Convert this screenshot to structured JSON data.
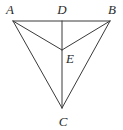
{
  "figure": {
    "background_color": "#ffffff",
    "stroke_color": "#3a3a3a",
    "stroke_width": 1,
    "label_color": "#2b2b2b",
    "width": 123,
    "height": 130
  },
  "points": [
    {
      "name": "A",
      "label": "A",
      "x": 13,
      "y": 21,
      "label_x": 10,
      "label_y": 9
    },
    {
      "name": "D",
      "label": "D",
      "x": 62,
      "y": 21,
      "label_x": 62,
      "label_y": 9
    },
    {
      "name": "B",
      "label": "B",
      "x": 110,
      "y": 21,
      "label_x": 112,
      "label_y": 9
    },
    {
      "name": "E",
      "label": "E",
      "x": 62,
      "y": 50,
      "label_x": 70,
      "label_y": 58
    },
    {
      "name": "C",
      "label": "C",
      "x": 62,
      "y": 108,
      "label_x": 63,
      "label_y": 121
    }
  ],
  "segments": [
    {
      "name": "segment-AB",
      "from": "A",
      "to": "B",
      "x1": 13,
      "y1": 21,
      "x2": 110,
      "y2": 21
    },
    {
      "name": "segment-AC",
      "from": "A",
      "to": "C",
      "x1": 13,
      "y1": 21,
      "x2": 62,
      "y2": 108
    },
    {
      "name": "segment-BC",
      "from": "B",
      "to": "C",
      "x1": 110,
      "y1": 21,
      "x2": 62,
      "y2": 108
    },
    {
      "name": "segment-DC",
      "from": "D",
      "to": "C",
      "x1": 62,
      "y1": 21,
      "x2": 62,
      "y2": 108
    },
    {
      "name": "segment-AE",
      "from": "A",
      "to": "E",
      "x1": 13,
      "y1": 21,
      "x2": 62,
      "y2": 50
    },
    {
      "name": "segment-BE",
      "from": "B",
      "to": "E",
      "x1": 110,
      "y1": 21,
      "x2": 62,
      "y2": 50
    }
  ]
}
